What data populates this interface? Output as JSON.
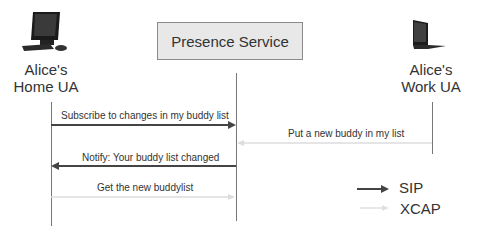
{
  "diagram": {
    "actors": [
      {
        "id": "home",
        "label_line1": "Alice's",
        "label_line2": "Home UA",
        "icon": "desktop-computer-icon"
      },
      {
        "id": "service",
        "label": "Presence Service"
      },
      {
        "id": "work",
        "label_line1": "Alice's",
        "label_line2": "Work UA",
        "icon": "laptop-icon"
      }
    ],
    "messages": [
      {
        "label": "Subscribe to changes in my buddy list",
        "from": "home",
        "to": "service",
        "protocol": "SIP"
      },
      {
        "label": "Put a new buddy in my list",
        "from": "work",
        "to": "service",
        "protocol": "XCAP"
      },
      {
        "label": "Notify: Your buddy list changed",
        "from": "service",
        "to": "home",
        "protocol": "SIP"
      },
      {
        "label": "Get the new buddylist",
        "from": "home",
        "to": "service",
        "protocol": "XCAP"
      }
    ],
    "legend": [
      {
        "label": "SIP",
        "color": "#444444"
      },
      {
        "label": "XCAP",
        "color": "#dddddd"
      }
    ]
  }
}
